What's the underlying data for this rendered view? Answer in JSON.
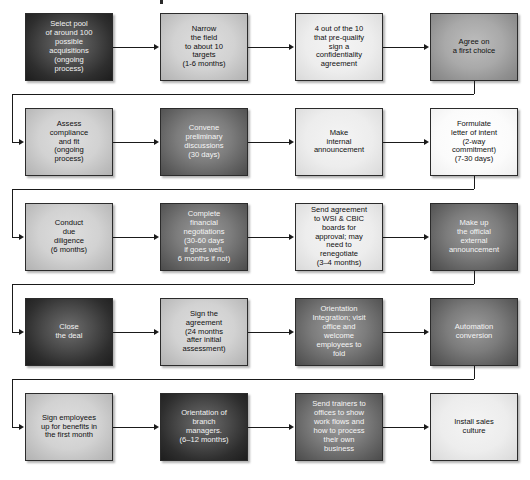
{
  "diagram": {
    "colors": {
      "line": "#1a1a1a",
      "border": "#2b2b2b",
      "background": "#ffffff"
    },
    "rows": [
      {
        "index": 1,
        "nodes": [
          {
            "id": "n1",
            "tone": "vdark",
            "text": "Select pool\nof around 100\npossible\nacquisitions\n(ongoing\nprocess)"
          },
          {
            "id": "n2",
            "tone": "light",
            "text": "Narrow\nthe field\nto about 10\ntargets\n(1-6 months)"
          },
          {
            "id": "n3",
            "tone": "vlight",
            "text": "4 out of the 10\nthat pre-qualify\nsign a\nconfidentiality\nagreement"
          },
          {
            "id": "n4",
            "tone": "mid",
            "text": "Agree on\na first choice"
          }
        ]
      },
      {
        "index": 2,
        "nodes": [
          {
            "id": "n5",
            "tone": "light",
            "text": "Assess\ncompliance\nand fit\n(ongoing\nprocess)"
          },
          {
            "id": "n6",
            "tone": "dark",
            "text": "Convene\npreliminary\ndiscussions\n(30 days)"
          },
          {
            "id": "n7",
            "tone": "vlight",
            "text": "Make\ninternal\nannouncement"
          },
          {
            "id": "n8",
            "tone": "white",
            "text": "Formulate\nletter of intent\n(2-way\ncommitment)\n(7-30 days)"
          }
        ]
      },
      {
        "index": 3,
        "nodes": [
          {
            "id": "n9",
            "tone": "light",
            "text": "Conduct\ndue\ndiligence\n(6 months)"
          },
          {
            "id": "n10",
            "tone": "dark",
            "text": "Complete\nfinancial\nnegotiations\n(30-60 days\nif goes well,\n6 months if not)"
          },
          {
            "id": "n11",
            "tone": "vlight",
            "text": "Send agreement\nto WSI & CBIC\nboards for\napproval; may\nneed to\nrenegotiate\n(3–4 months)"
          },
          {
            "id": "n12",
            "tone": "dark",
            "text": "Make up\nthe official\nexternal\nannouncement"
          }
        ]
      },
      {
        "index": 4,
        "nodes": [
          {
            "id": "n13",
            "tone": "vdark",
            "text": "Close\nthe deal"
          },
          {
            "id": "n14",
            "tone": "light",
            "text": "Sign the\nagreement\n(24 months\nafter initial\nassessment)"
          },
          {
            "id": "n15",
            "tone": "dark",
            "text": "Orientation\nIntegration; visit\noffice and\nwelcome\nemployees to\nfold"
          },
          {
            "id": "n16",
            "tone": "dark",
            "text": "Automation\nconversion"
          }
        ]
      },
      {
        "index": 5,
        "nodes": [
          {
            "id": "n17",
            "tone": "light",
            "text": "Sign employees\nup for benefits in\nthe first month"
          },
          {
            "id": "n18",
            "tone": "vdark",
            "text": "Orientation of\nbranch\nmanagers.\n(6–12 months)"
          },
          {
            "id": "n19",
            "tone": "dark",
            "text": "Send trainers to\noffices to show\nwork flows and\nhow to process\ntheir own\nbusiness"
          },
          {
            "id": "n20",
            "tone": "vlight",
            "text": "Install sales\nculture"
          }
        ]
      }
    ]
  }
}
